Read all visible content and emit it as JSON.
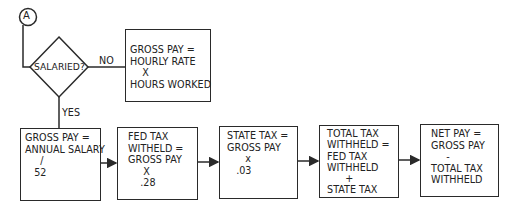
{
  "diagram": {
    "connector": {
      "label": "A"
    },
    "decision": {
      "label": "SALARIED?"
    },
    "edge_labels": {
      "no": "NO",
      "yes": "YES"
    },
    "hourly_box": {
      "lines": [
        "GROSS PAY =",
        "HOURLY RATE",
        "    X",
        "HOURS WORKED"
      ]
    },
    "process_boxes": [
      {
        "id": "gross-salary",
        "lines": [
          "GROSS PAY =",
          "ANNUAL SALARY",
          "     /",
          "   52"
        ]
      },
      {
        "id": "fed-tax",
        "lines": [
          "  FED TAX",
          "  WITHELD =",
          "  GROSS PAY",
          "       X",
          "      .28"
        ]
      },
      {
        "id": "state-tax",
        "lines": [
          " STATE TAX =",
          " GROSS PAY",
          "       x",
          "    .03"
        ]
      },
      {
        "id": "total-tax",
        "lines": [
          " TOTAL TAX",
          " WITHHELD =",
          " FED TAX",
          " WITHHELD",
          "       +",
          " STATE TAX"
        ]
      },
      {
        "id": "net-pay",
        "lines": [
          "  NET PAY =",
          "  GROSS PAY",
          "       -",
          "  TOTAL TAX",
          "  WITHHELD"
        ]
      }
    ]
  }
}
